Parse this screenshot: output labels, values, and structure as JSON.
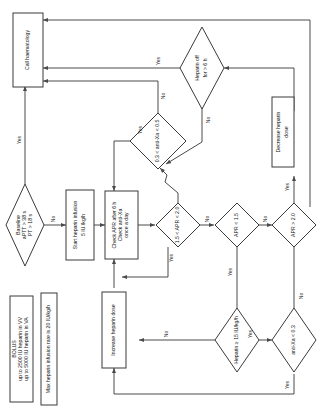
{
  "diagram": {
    "orientation": "rotated-90-ccw",
    "colors": {
      "stroke": "#3a3a3a",
      "edge": "#4a4a4a",
      "fill": "#ffffff",
      "text": "#111111"
    },
    "nodes": [
      {
        "id": "call_haem",
        "type": "process",
        "lines": [
          "Call haematology"
        ]
      },
      {
        "id": "baseline",
        "type": "decision",
        "lines": [
          "Baseline",
          "aPTT > 38 s",
          "PT > 18 s"
        ]
      },
      {
        "id": "start_inf",
        "type": "process",
        "lines": [
          "Start heparin infusion",
          "5 IU /kg/h"
        ]
      },
      {
        "id": "check_apr",
        "type": "process",
        "lines": [
          "Check APR after 6 h",
          "Check anti-Xa",
          "once a day"
        ]
      },
      {
        "id": "apr_range",
        "type": "decision",
        "lines": [
          "1.5 < APR < 2.0"
        ]
      },
      {
        "id": "apr_low",
        "type": "decision",
        "lines": [
          "APR < 1.5"
        ]
      },
      {
        "id": "apr_high",
        "type": "decision",
        "lines": [
          "APR > 2.0"
        ]
      },
      {
        "id": "antixa_range",
        "type": "decision",
        "lines": [
          "0.3 < anti-Xa < 0.5"
        ]
      },
      {
        "id": "hep_off",
        "type": "decision",
        "lines": [
          "Heparin off",
          "for > 6 h"
        ]
      },
      {
        "id": "dec_dose",
        "type": "process",
        "lines": [
          "Decrease heparin",
          "dose"
        ]
      },
      {
        "id": "inc_dose",
        "type": "process",
        "lines": [
          "Increase heparin dose"
        ]
      },
      {
        "id": "hep_rate",
        "type": "decision",
        "lines": [
          "Heparin ≥ 15 IU/kg/h"
        ]
      },
      {
        "id": "antixa_low",
        "type": "decision",
        "lines": [
          "anti-Xa < 0.3"
        ]
      },
      {
        "id": "bolus_note",
        "type": "note",
        "lines": [
          "BOLUS",
          "up to 2500 IU heparin in VV",
          "up to 5000 IU heparin in VA"
        ]
      },
      {
        "id": "max_note",
        "type": "note",
        "lines": [
          "Max heparin infusion rate is 20 IU/kg/h"
        ]
      }
    ],
    "edge_labels": {
      "baseline_yes": "Yes",
      "baseline_no": "No",
      "apr_range_yes": "Yes",
      "apr_range_no": "No",
      "apr_low_yes": "Yes",
      "apr_low_no": "No",
      "apr_high_yes": "Yes",
      "apr_high_no": "No",
      "antixa_range_yes": "Yes",
      "antixa_range_no": "No",
      "hep_off_yes": "Yes",
      "hep_off_no": "No",
      "hep_rate_yes": "Yes",
      "hep_rate_no": "No",
      "antixa_low_yes": "Yes",
      "antixa_low_no": "No"
    }
  }
}
